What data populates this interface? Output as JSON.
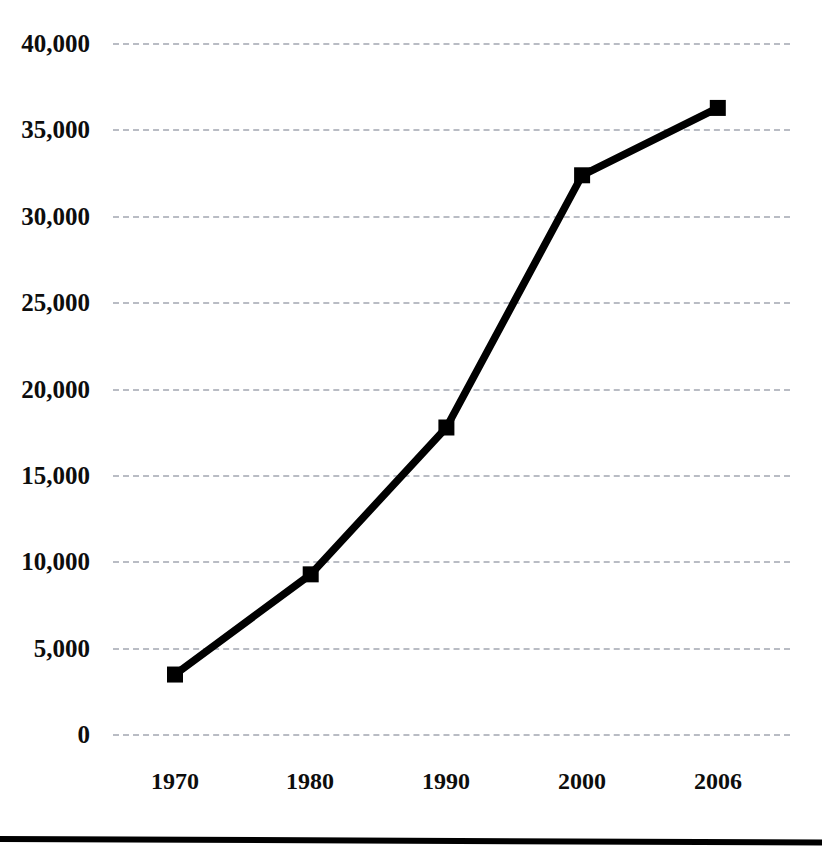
{
  "chart_data": {
    "type": "line",
    "title": "",
    "subtitle": "",
    "xlabel": "",
    "ylabel": "",
    "categories": [
      "1970",
      "1980",
      "1990",
      "2000",
      "2006"
    ],
    "x": [
      1970,
      1980,
      1990,
      2000,
      2006
    ],
    "values": [
      3500,
      9300,
      17800,
      32400,
      36300
    ],
    "series": [
      {
        "name": "",
        "values": [
          3500,
          9300,
          17800,
          32400,
          36300
        ]
      }
    ],
    "ylim": [
      0,
      40000
    ],
    "yticks": [
      40000,
      35000,
      30000,
      25000,
      20000,
      15000,
      10000,
      5000,
      0
    ],
    "ytick_labels": [
      "40,000",
      "35,000",
      "30,000",
      "25,000",
      "20,000",
      "15,000",
      "10,000",
      "5,000",
      "0"
    ],
    "xtick_labels": [
      "1970",
      "1980",
      "1990",
      "2000",
      "2006"
    ],
    "grid": true,
    "grid_axis": "y",
    "grid_style": "dashed",
    "legend": false,
    "legend_position": "none",
    "marker": "square",
    "line_color": "#000000",
    "marker_color": "#000000",
    "grid_color": "#b9bcc4",
    "background_color": "#ffffff",
    "annotations": []
  },
  "figure": {
    "bottom_rule_color": "#000000"
  }
}
